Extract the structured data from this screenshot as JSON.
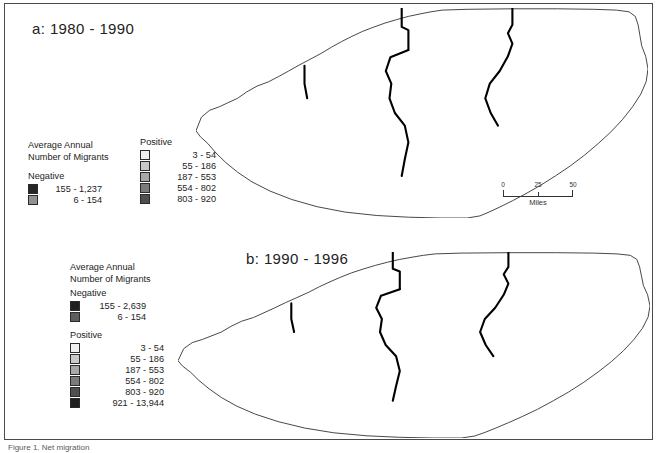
{
  "figure": {
    "caption": "Figure 1. Net migration",
    "border_color": "#4a4a4a"
  },
  "panels": [
    {
      "id": "a",
      "title": "a: 1980 - 1990"
    },
    {
      "id": "b",
      "title": "b: 1990 - 1996"
    }
  ],
  "legend_a": {
    "heading_line1": "Average Annual",
    "heading_line2": "Number of Migrants",
    "negative_title": "Negative",
    "negative_classes": [
      {
        "label": "155 - 1,237",
        "color": "#262626"
      },
      {
        "label": "6 - 154",
        "color": "#919191"
      }
    ],
    "positive_title": "Positive",
    "positive_classes": [
      {
        "label": "3 - 54",
        "color": "#efefef"
      },
      {
        "label": "55 - 186",
        "color": "#c9c9c9"
      },
      {
        "label": "187 - 553",
        "color": "#a8a8a8"
      },
      {
        "label": "554 - 802",
        "color": "#7b7b7b"
      },
      {
        "label": "803 - 920",
        "color": "#4f4f4f"
      }
    ]
  },
  "legend_b": {
    "heading_line1": "Average Annual",
    "heading_line2": "Number of Migrants",
    "negative_title": "Negative",
    "negative_classes": [
      {
        "label": "155 - 2,639",
        "color": "#1f1f1f"
      },
      {
        "label": "6 - 154",
        "color": "#5e5e5e"
      }
    ],
    "positive_title": "Positive",
    "positive_classes": [
      {
        "label": "3 - 54",
        "color": "#efefef"
      },
      {
        "label": "55 - 186",
        "color": "#c9c9c9"
      },
      {
        "label": "187 - 553",
        "color": "#a8a8a8"
      },
      {
        "label": "554 - 802",
        "color": "#7b7b7b"
      },
      {
        "label": "803 - 920",
        "color": "#4f4f4f"
      },
      {
        "label": "921 - 13,944",
        "color": "#1f1f1f"
      }
    ]
  },
  "scalebar": {
    "min": "0",
    "mid": "25",
    "max": "50",
    "units": "Miles"
  },
  "chart_data": {
    "type": "map",
    "subtype": "choropleth",
    "region": "North Carolina",
    "legend_position": "left",
    "grid": false,
    "panels": [
      {
        "id": "a",
        "title": "a: 1980 - 1990",
        "classes": [
          {
            "label": "155 - 1,237",
            "sign": "negative",
            "color": "#262626"
          },
          {
            "label": "6 - 154",
            "sign": "negative",
            "color": "#919191"
          },
          {
            "label": "3 - 54",
            "sign": "positive",
            "color": "#efefef"
          },
          {
            "label": "55 - 186",
            "sign": "positive",
            "color": "#c9c9c9"
          },
          {
            "label": "187 - 553",
            "sign": "positive",
            "color": "#a8a8a8"
          },
          {
            "label": "554 - 802",
            "sign": "positive",
            "color": "#7b7b7b"
          },
          {
            "label": "803 - 920",
            "sign": "positive",
            "color": "#4f4f4f"
          }
        ]
      },
      {
        "id": "b",
        "title": "b: 1990 - 1996",
        "classes": [
          {
            "label": "155 - 2,639",
            "sign": "negative",
            "color": "#1f1f1f"
          },
          {
            "label": "6 - 154",
            "sign": "negative",
            "color": "#5e5e5e"
          },
          {
            "label": "3 - 54",
            "sign": "positive",
            "color": "#efefef"
          },
          {
            "label": "55 - 186",
            "sign": "positive",
            "color": "#c9c9c9"
          },
          {
            "label": "187 - 553",
            "sign": "positive",
            "color": "#a8a8a8"
          },
          {
            "label": "554 - 802",
            "sign": "positive",
            "color": "#7b7b7b"
          },
          {
            "label": "803 - 920",
            "sign": "positive",
            "color": "#4f4f4f"
          },
          {
            "label": "921 - 13,944",
            "sign": "positive",
            "color": "#1f1f1f"
          }
        ]
      }
    ],
    "scale": {
      "min": 0,
      "mid": 25,
      "max": 50,
      "units": "Miles"
    }
  }
}
